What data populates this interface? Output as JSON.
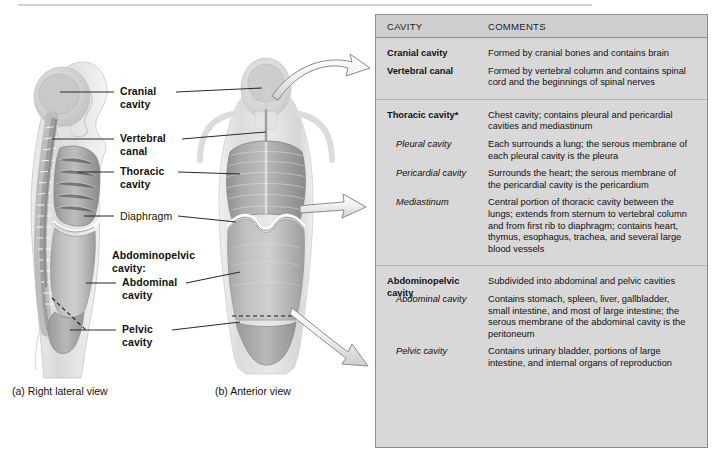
{
  "figure": {
    "labels": [
      {
        "id": "cranial-cavity",
        "text_line1": "Cranial",
        "text_line2": "cavity",
        "weight": "bold"
      },
      {
        "id": "vertebral-canal",
        "text_line1": "Vertebral",
        "text_line2": "canal",
        "weight": "bold"
      },
      {
        "id": "thoracic-cavity",
        "text_line1": "Thoracic",
        "text_line2": "cavity",
        "weight": "bold"
      },
      {
        "id": "diaphragm",
        "text_line1": "Diaphragm",
        "text_line2": "",
        "weight": "regular"
      },
      {
        "id": "abdominopelvic-cavity",
        "text_line1": "Abdominopelvic",
        "text_line2": "cavity:",
        "weight": "bold"
      },
      {
        "id": "abdominal-cavity",
        "text_line1": "Abdominal",
        "text_line2": "cavity",
        "weight": "bold"
      },
      {
        "id": "pelvic-cavity",
        "text_line1": "Pelvic",
        "text_line2": "cavity",
        "weight": "bold"
      }
    ],
    "captions": {
      "a": "(a) Right lateral view",
      "b": "(b) Anterior view"
    }
  },
  "table": {
    "headers": {
      "cavity": "CAVITY",
      "comments": "COMMENTS"
    },
    "groups": [
      {
        "rows": [
          {
            "term": "Cranial cavity",
            "style": "head",
            "desc": "Formed by cranial bones and contains brain"
          },
          {
            "term": "Vertebral canal",
            "style": "head",
            "desc": "Formed by vertebral column and contains spinal cord and the beginnings of spinal nerves"
          }
        ]
      },
      {
        "rows": [
          {
            "term": "Thoracic cavity*",
            "style": "head",
            "desc": "Chest cavity; contains pleural and pericardial cavities and mediastinum"
          },
          {
            "term": "Pleural cavity",
            "style": "sub",
            "desc": "Each surrounds a lung; the serous membrane of each pleural cavity is the pleura"
          },
          {
            "term": "Pericardial cavity",
            "style": "sub",
            "desc": "Surrounds the heart; the serous membrane of the pericardial cavity is the pericardium"
          },
          {
            "term": "Mediastinum",
            "style": "sub",
            "desc": "Central portion of thoracic cavity between the lungs; extends from sternum to vertebral column and from first rib to diaphragm; contains heart, thymus, esophagus, trachea, and several large blood vessels"
          }
        ]
      },
      {
        "rows": [
          {
            "term": "Abdominopelvic cavity",
            "style": "head",
            "desc": "Subdivided into abdominal and pelvic cavities"
          },
          {
            "term": "Abdominal cavity",
            "style": "sub",
            "desc": "Contains stomach, spleen, liver, gallbladder, small intestine, and most of large intestine; the serous membrane of the abdominal cavity is the peritoneum"
          },
          {
            "term": "Pelvic cavity",
            "style": "sub",
            "desc": "Contains urinary bladder, portions of large intestine, and internal organs of reproduction"
          }
        ]
      }
    ]
  },
  "colors": {
    "table_bg": "#d8d8d8",
    "table_header_bg": "#cfcfcf",
    "table_border": "#8c8c8c",
    "row_divider": "#b6b6b6",
    "text": "#111111",
    "leader_line": "#2b2b2b",
    "arrow_stroke": "#8a8a8a"
  }
}
